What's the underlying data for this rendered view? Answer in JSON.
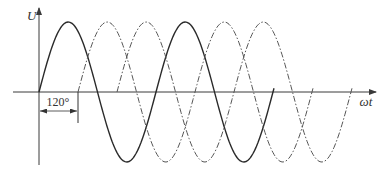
{
  "diagram": {
    "y_axis_label": "U",
    "x_axis_label": "ωt",
    "phase_shift_label": "120°",
    "colors": {
      "axis": "#3a3a3a",
      "solid_curve": "#2a2a2a",
      "dashed_curve": "#555555",
      "text": "#333333"
    },
    "geometry": {
      "origin_x": 39,
      "axis_y": 92,
      "amplitude": 70,
      "period_px": 117,
      "phase_shift_px": 39
    },
    "curves": [
      {
        "name": "phase-1",
        "style": "solid",
        "phase_deg": 0,
        "start_x": 39,
        "end_x": 274
      },
      {
        "name": "phase-2",
        "style": "dashed",
        "phase_deg": 120,
        "start_x": 78,
        "end_x": 313
      },
      {
        "name": "phase-3",
        "style": "dashed",
        "phase_deg": 240,
        "start_x": 117,
        "end_x": 352
      }
    ]
  }
}
